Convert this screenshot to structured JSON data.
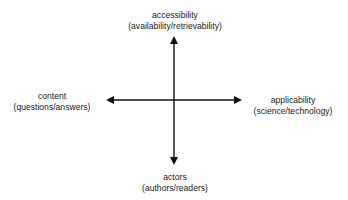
{
  "diagram": {
    "type": "quadrant-axes",
    "colors": {
      "axis": "#111111",
      "text": "#1a1a1a",
      "background": "#ffffff"
    },
    "axes": {
      "top": {
        "title": "accessibility",
        "subtitle": "(availability/retrievability)"
      },
      "bottom": {
        "title": "actors",
        "subtitle": "(authors/readers)"
      },
      "left": {
        "title": "content",
        "subtitle": "(questions/answers)"
      },
      "right": {
        "title": "applicability",
        "subtitle": "(science/technology)"
      }
    }
  }
}
